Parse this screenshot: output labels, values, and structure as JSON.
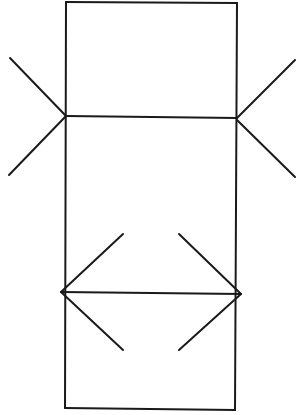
{
  "figure": {
    "stroke_color": "#1a1a1a",
    "background_color": "#ffffff",
    "segments": [
      {
        "name": "upper-segment",
        "fin_style": "outward-fins"
      },
      {
        "name": "lower-segment",
        "fin_style": "arrowheads"
      }
    ]
  }
}
